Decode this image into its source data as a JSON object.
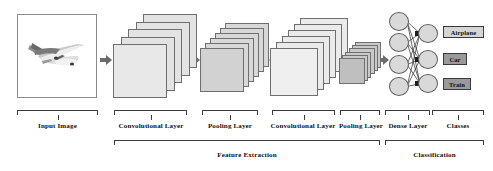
{
  "diagram": {
    "background": "#ffffff",
    "input": {
      "label": "Input Image",
      "content_icon": "airplane-photo",
      "box_fill": "#fdfdfd",
      "border": "#8a8a8a"
    },
    "stages": [
      {
        "id": "conv1",
        "label": "Convolutional Layer",
        "kind": "convolutional",
        "cards": 5,
        "card_size": 54,
        "fill": "#e3e3e3",
        "front_fill": "#e8e8e8"
      },
      {
        "id": "pool1",
        "label": "Pooling Layer",
        "kind": "pooling",
        "cards": 6,
        "card_size": 44,
        "fill": "#d8d8d8",
        "front_fill": "#d2d2d2"
      },
      {
        "id": "conv2",
        "label": "Convolutional Layer",
        "kind": "convolutional",
        "cards": 6,
        "card_size": 48,
        "fill": "#ebebeb",
        "front_fill": "#efefef"
      },
      {
        "id": "pool2",
        "label": "Pooling Layer",
        "kind": "pooling",
        "cards": 6,
        "card_size": 26,
        "fill": "#c9c9c9",
        "front_fill": "#bfbfbf"
      }
    ],
    "dense": {
      "label": "Dense Layer",
      "hidden_nodes": 4,
      "output_nodes": 3,
      "node_fill": "#d9d9d9",
      "node_border": "#5e5e5e",
      "edge_color": "#2a2a2a"
    },
    "classes": {
      "label": "Classes",
      "items": [
        {
          "name": "Airplane",
          "fill": "#d5d5d5",
          "text": "#111111"
        },
        {
          "name": "Car",
          "fill": "#9a9a9a",
          "text": "#111111"
        },
        {
          "name": "Train",
          "fill": "#9a9a9a",
          "text": "#111111"
        }
      ]
    },
    "groups": [
      {
        "id": "feature-extraction",
        "label": "Feature Extraction"
      },
      {
        "id": "classification",
        "label": "Classification"
      }
    ],
    "arrow_color": "#6b6b6b"
  }
}
